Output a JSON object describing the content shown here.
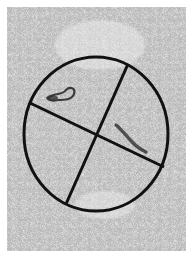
{
  "image": {
    "description": "Grayscale histological micrograph with a circular grid overlay divided into four sectors by two crossing lines",
    "background_color": "#ffffff",
    "tissue_base_color": "#c9c9c9",
    "overlay_color": "#111111"
  },
  "overlay": {
    "circle": {
      "cx": 96,
      "cy": 134,
      "rx": 72,
      "ry": 77,
      "stroke_width": 3
    },
    "lines": [
      {
        "x1": 30,
        "y1": 103,
        "x2": 164,
        "y2": 167
      },
      {
        "x1": 128,
        "y1": 64,
        "x2": 66,
        "y2": 204
      }
    ]
  },
  "features": [
    {
      "name": "vessel-upper-left",
      "x": 62,
      "y": 95
    },
    {
      "name": "vessel-lower-right",
      "x": 130,
      "y": 140
    }
  ]
}
